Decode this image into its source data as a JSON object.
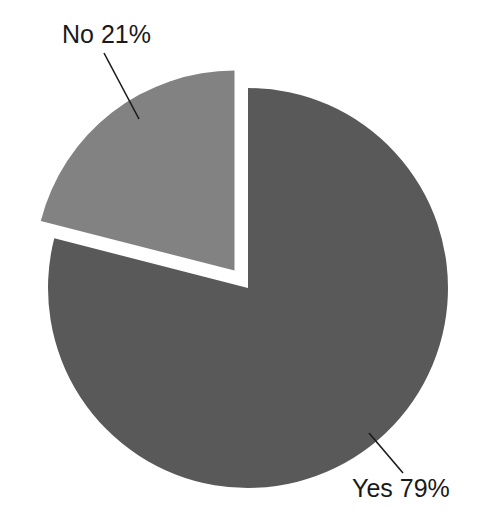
{
  "chart_data": {
    "type": "pie",
    "title": "",
    "subtitle": "",
    "xlabel": "",
    "ylabel": "",
    "grid": false,
    "legend_position": "none",
    "labels_position": "outside-with-leader-lines",
    "categories": [
      "Yes",
      "No"
    ],
    "values": [
      79,
      21
    ],
    "units": "%",
    "slices": [
      {
        "name": "Yes",
        "value": 79,
        "label": "Yes 79%",
        "color": "#595959",
        "exploded": false,
        "start_angle_deg": 75.6,
        "end_angle_deg": 360.0
      },
      {
        "name": "No",
        "value": 21,
        "label": "No 21%",
        "color": "#828282",
        "exploded": true,
        "start_angle_deg": 0.0,
        "end_angle_deg": 75.6
      }
    ],
    "annotations": [
      {
        "text": "No 21%",
        "x": 62,
        "y": 43
      },
      {
        "text": "Yes 79%",
        "x": 352,
        "y": 497
      }
    ]
  },
  "chart": {
    "background_color": "#ffffff",
    "text_color": "#1a1a1a",
    "leader_line_color": "#1a1a1a",
    "center_x": 248,
    "center_y": 288,
    "radius": 200,
    "explode_offset": 22
  },
  "labels": {
    "no": "No 21%",
    "yes": "Yes 79%"
  }
}
